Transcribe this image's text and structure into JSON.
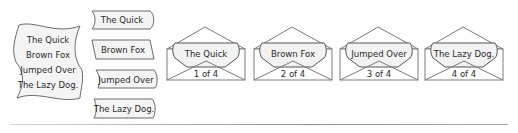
{
  "stacked_banner": {
    "lines": [
      "The Quick",
      "Brown Fox",
      "Jumped Over",
      "The Lazy Dog."
    ]
  },
  "separate_banners": [
    {
      "label": "The Quick",
      "shape": "scroll-left-curl"
    },
    {
      "label": "Brown Fox",
      "shape": "parallelogram"
    },
    {
      "label": "Jumped Over",
      "shape": "wave"
    },
    {
      "label": "The Lazy Dog.",
      "shape": "wave"
    }
  ],
  "envelopes": [
    {
      "label": "The Quick",
      "page": "1 of 4"
    },
    {
      "label": "Brown Fox",
      "page": "2 of 4"
    },
    {
      "label": "Jumped Over",
      "page": "3 of 4"
    },
    {
      "label": "The Lazy Dog.",
      "page": "4 of 4"
    }
  ],
  "colors": {
    "shape_fill": "#f4f4f4",
    "stroke": "#6a6a6a",
    "text": "#2a2a2a"
  }
}
